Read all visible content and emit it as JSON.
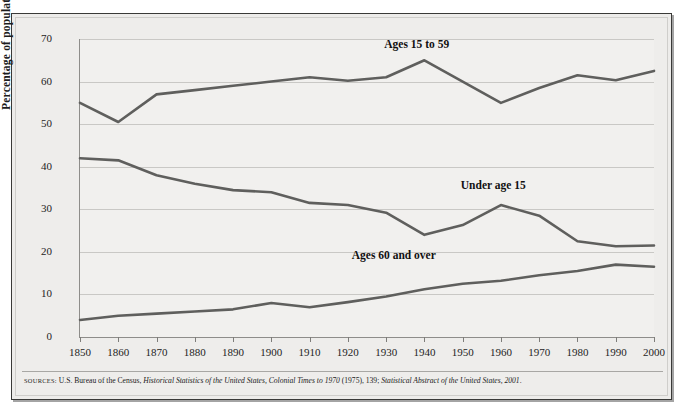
{
  "figure": {
    "y_axis_title": "Percentage of population",
    "source_prefix": "SOURCES:",
    "source_text_1": " U.S. Bureau of the Census, ",
    "source_italic_1": "Historical Statistics of the United States, Colonial Times to 1970",
    "source_text_2": " (1975), 139; ",
    "source_italic_2": "Statistical Abstract of the United States, 2001",
    "source_text_3": "."
  },
  "colors": {
    "line": "#5f5f5d",
    "grid": "#c9c8c5",
    "axis": "#8e8d8a",
    "panel": "#f1f0ee",
    "frame_bg": "#edecea",
    "frame_border": "#3a3a38",
    "text": "#1c1c1c"
  },
  "chart_data": {
    "type": "line",
    "title": "",
    "xlabel": "",
    "ylabel": "Percentage of population",
    "xlim": [
      1850,
      2000
    ],
    "ylim": [
      0,
      70
    ],
    "ytick_step": 10,
    "grid": true,
    "legend": "inline-annotations",
    "x": [
      1850,
      1860,
      1870,
      1880,
      1890,
      1900,
      1910,
      1920,
      1930,
      1940,
      1950,
      1960,
      1970,
      1980,
      1990,
      2000
    ],
    "xticks": [
      "1850",
      "1860",
      "1870",
      "1880",
      "1890",
      "1900",
      "1910",
      "1920",
      "1930",
      "1940",
      "1950",
      "1960",
      "1970",
      "1980",
      "1990",
      "2000"
    ],
    "yticks": [
      "0",
      "10",
      "20",
      "30",
      "40",
      "50",
      "60",
      "70"
    ],
    "series": [
      {
        "name": "Ages 15 to 59",
        "label": "Ages 15 to 59",
        "values": [
          55.0,
          50.5,
          57.0,
          58.0,
          59.0,
          60.0,
          61.0,
          60.2,
          61.0,
          65.0,
          60.0,
          55.0,
          58.5,
          61.5,
          60.3,
          62.5
        ]
      },
      {
        "name": "Under age 15",
        "label": "Under age 15",
        "values": [
          42.0,
          41.5,
          38.0,
          36.0,
          34.5,
          34.0,
          31.5,
          31.0,
          29.2,
          24.0,
          26.3,
          31.0,
          28.5,
          22.5,
          21.3,
          21.5
        ]
      },
      {
        "name": "Ages 60 and over",
        "label": "Ages 60 and over",
        "values": [
          4.0,
          5.0,
          5.5,
          6.0,
          6.5,
          8.0,
          7.0,
          8.2,
          9.5,
          11.2,
          12.5,
          13.2,
          14.5,
          15.5,
          17.0,
          16.5
        ]
      }
    ],
    "annotations": [
      {
        "text": "Ages 15 to 59",
        "x": 1938,
        "y": 68.5
      },
      {
        "text": "Under age 15",
        "x": 1958,
        "y": 35.5
      },
      {
        "text": "Ages 60 and over",
        "x": 1932,
        "y": 19.0
      }
    ]
  }
}
